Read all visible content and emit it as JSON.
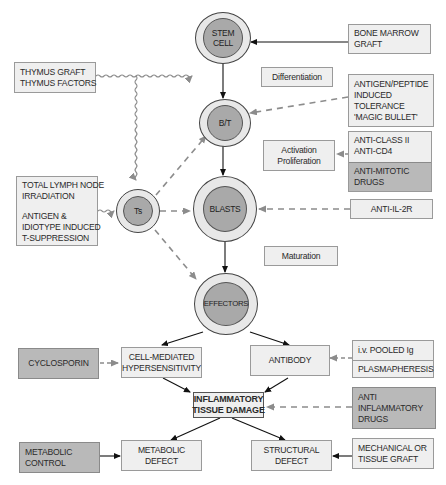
{
  "cells": {
    "stem": [
      "STEM",
      "CELL"
    ],
    "bt": [
      "B/T"
    ],
    "ts": [
      "Ts"
    ],
    "blasts": [
      "BLASTS"
    ],
    "effectors": [
      "EFFECTORS"
    ]
  },
  "stages": {
    "differentiation": "Differentiation",
    "activation": [
      "Activation",
      "Proliferation"
    ],
    "maturation": "Maturation"
  },
  "interventions": {
    "bone_marrow": [
      "BONE MARROW",
      "GRAFT"
    ],
    "thymus": [
      "THYMUS GRAFT",
      "THYMUS FACTORS"
    ],
    "antigen_peptide": [
      "ANTIGEN/PEPTIDE",
      "INDUCED",
      "TOLERANCE",
      "'MAGIC BULLET'"
    ],
    "anti_class": [
      "ANTI-CLASS II",
      "ANTI-CD4"
    ],
    "anti_mitotic": [
      "ANTI-MITOTIC",
      "DRUGS"
    ],
    "anti_il2r": "ANTI-IL-2R",
    "total_lymph": [
      "TOTAL LYMPH NODE",
      "IRRADIATION"
    ],
    "antigen_idiotype": [
      "ANTIGEN &",
      "IDIOTYPE INDUCED",
      "T-SUPPRESSION"
    ],
    "cyclosporin": "CYCLOSPORIN",
    "pooled_ig": "i.v. POOLED Ig",
    "plasmapheresis": "PLASMAPHERESIS",
    "anti_inflammatory": [
      "ANTI",
      "INFLAMMATORY",
      "DRUGS"
    ],
    "metabolic_control": [
      "METABOLIC",
      "CONTROL"
    ],
    "mechanical_graft": [
      "MECHANICAL OR",
      "TISSUE GRAFT"
    ]
  },
  "outcomes": {
    "cell_mediated": [
      "CELL-MEDIATED",
      "HYPERSENSITIVITY"
    ],
    "antibody": "ANTIBODY",
    "inflammatory": [
      "INFLAMMATORY",
      "TISSUE DAMAGE"
    ],
    "metabolic_defect": "METABOLIC DEFECT",
    "structural_defect": "STRUCTURAL DEFECT"
  },
  "colors": {
    "light_box": "#efefef",
    "dark_box": "#b9b9b9",
    "cell_outer": "#e8e8e8",
    "cell_inner": "#a9a9a9",
    "dashed_arrow": "#8c8c8c",
    "solid_arrow": "#111111"
  }
}
